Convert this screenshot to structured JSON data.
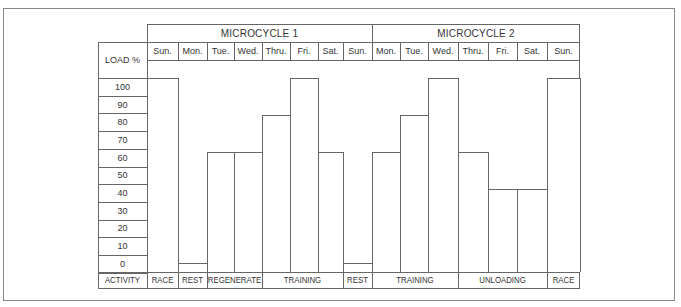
{
  "header": {
    "load_label": "LOAD %",
    "activity_label": "ACTIVITY",
    "microcycles": [
      {
        "label": "MICROCYCLE 1"
      },
      {
        "label": "MICROCYCLE 2"
      }
    ],
    "days": [
      "Sun.",
      "Mon.",
      "Tue.",
      "Wed.",
      "Thru.",
      "Fri.",
      "Sat.",
      "Sun.",
      "Mon.",
      "Tue.",
      "Wed.",
      "Thru.",
      "Fri.",
      "Sat.",
      "Sun."
    ],
    "y_ticks": [
      "100",
      "90",
      "80",
      "70",
      "60",
      "50",
      "40",
      "30",
      "20",
      "10",
      "0"
    ]
  },
  "activities": [
    {
      "label": "RACE"
    },
    {
      "label": "REST"
    },
    {
      "label": "REGENERATE"
    },
    {
      "label": "TRAINING"
    },
    {
      "label": "REST"
    },
    {
      "label": "TRAINING"
    },
    {
      "label": "UNLOADING"
    },
    {
      "label": "RACE"
    }
  ],
  "chart_data": {
    "type": "bar",
    "title": "",
    "xlabel": "",
    "ylabel": "LOAD %",
    "ylim": [
      0,
      100
    ],
    "grid": false,
    "groups": [
      "MICROCYCLE 1",
      "MICROCYCLE 2"
    ],
    "categories": [
      "Sun.",
      "Mon.",
      "Tue.",
      "Wed.",
      "Thru.",
      "Fri.",
      "Sat.",
      "Sun.",
      "Mon.",
      "Tue.",
      "Wed.",
      "Thru.",
      "Fri.",
      "Sat.",
      "Sun."
    ],
    "values": [
      105,
      5,
      65,
      65,
      85,
      105,
      65,
      5,
      65,
      85,
      105,
      65,
      45,
      45,
      105
    ],
    "activities": [
      {
        "label": "RACE",
        "days": [
          "Sun."
        ]
      },
      {
        "label": "REST",
        "days": [
          "Mon."
        ]
      },
      {
        "label": "REGENERATE",
        "days": [
          "Tue.",
          "Wed."
        ]
      },
      {
        "label": "TRAINING",
        "days": [
          "Thru.",
          "Fri.",
          "Sat."
        ]
      },
      {
        "label": "REST",
        "days": [
          "Sun."
        ]
      },
      {
        "label": "TRAINING",
        "days": [
          "Mon.",
          "Tue.",
          "Wed."
        ]
      },
      {
        "label": "UNLOADING",
        "days": [
          "Thru.",
          "Fri.",
          "Sat."
        ]
      },
      {
        "label": "RACE",
        "days": [
          "Sun."
        ]
      }
    ],
    "y_ticks": [
      0,
      10,
      20,
      30,
      40,
      50,
      60,
      70,
      80,
      90,
      100
    ]
  }
}
